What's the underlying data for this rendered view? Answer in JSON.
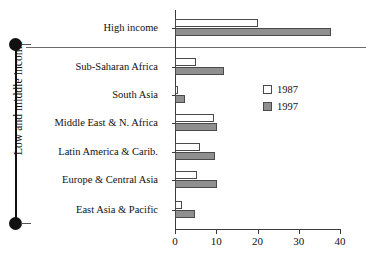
{
  "chart_data": {
    "type": "bar",
    "orientation": "horizontal",
    "title": "",
    "xlabel": "",
    "ylabel": "",
    "xlim": [
      0,
      40
    ],
    "xticks": [
      0,
      10,
      20,
      30,
      40
    ],
    "xtick_labels": [
      "0",
      "10",
      "20",
      "30",
      "40"
    ],
    "grid": false,
    "legend_position": "center-right",
    "categories": [
      "High income",
      "Sub-Saharan Africa",
      "South  Asia",
      "Middle East & N. Africa",
      "Latin America & Carib.",
      "Europe & Central Asia",
      "East Asia & Pacific"
    ],
    "series": [
      {
        "name": "1987",
        "values": [
          20.0,
          5.2,
          0.7,
          9.5,
          6.0,
          5.3,
          1.8
        ]
      },
      {
        "name": "1997",
        "values": [
          37.8,
          11.9,
          2.5,
          10.2,
          9.6,
          10.2,
          4.8
        ]
      }
    ],
    "annotations": {
      "group_bracket_label": "Low and middle income",
      "group_bracket_members": [
        "Sub-Saharan Africa",
        "South  Asia",
        "Middle East & N. Africa",
        "Latin America & Carib.",
        "Europe & Central Asia",
        "East Asia & Pacific"
      ]
    }
  },
  "legend": {
    "items": [
      {
        "label": "1987",
        "color": "#ffffff"
      },
      {
        "label": "1997",
        "color": "#8f8f8f"
      }
    ]
  },
  "axis": {
    "group_label": "Low and middle income"
  },
  "colors": {
    "series_1987": "#ffffff",
    "series_1997": "#8f8f8f",
    "outline": "#4a4a4a",
    "axis": "#3a3a3a",
    "text": "#111111",
    "background": "#ffffff"
  }
}
